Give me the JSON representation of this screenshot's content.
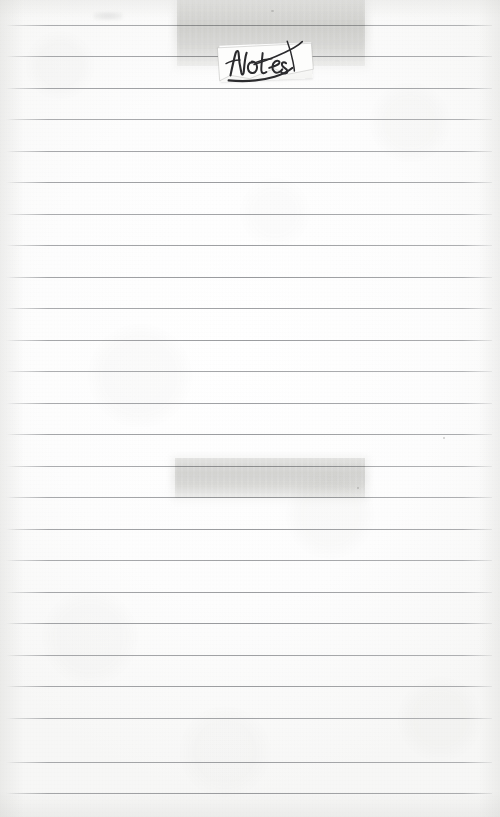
{
  "page": {
    "kind": "scanned-lined-notebook-page",
    "width": 500,
    "height": 817,
    "paper_color": "#fdfdfc",
    "rule_color": "#808286",
    "label_text": "Notes",
    "label_text_style": "handwritten-cursive-ink",
    "ink_color": "#2b2b2e"
  },
  "rules": {
    "count": 25,
    "first_y": 25,
    "spacing": 31.5,
    "left_x": 6,
    "right_x": 492,
    "y_positions": [
      25,
      56,
      88,
      119,
      151,
      182,
      214,
      245,
      277,
      308,
      340,
      371,
      403,
      434,
      466,
      497,
      529,
      560,
      592,
      623,
      655,
      686,
      718,
      762,
      793
    ]
  },
  "tapes": [
    {
      "name": "tape-strip-top",
      "x": 177,
      "y": 0,
      "width": 188,
      "height": 66,
      "tint": "#bcbcb8"
    },
    {
      "name": "tape-strip-middle",
      "x": 175,
      "y": 458,
      "width": 190,
      "height": 40,
      "tint": "#bcbcb8"
    }
  ],
  "label": {
    "name": "notes-label",
    "x": 220,
    "y": 44,
    "width": 92,
    "height": 36,
    "rotation_deg": -2.2,
    "text": "Notes"
  },
  "marks": [
    {
      "name": "smudge-top-left",
      "x": 93,
      "y": 12,
      "width": 30,
      "height": 8
    },
    {
      "name": "speck-upper-center",
      "x": 271,
      "y": 10,
      "width": 3,
      "height": 2
    },
    {
      "name": "speck-mid-right",
      "x": 357,
      "y": 487,
      "width": 2,
      "height": 2
    },
    {
      "name": "speck-upper-right",
      "x": 443,
      "y": 437,
      "width": 2,
      "height": 2
    }
  ]
}
